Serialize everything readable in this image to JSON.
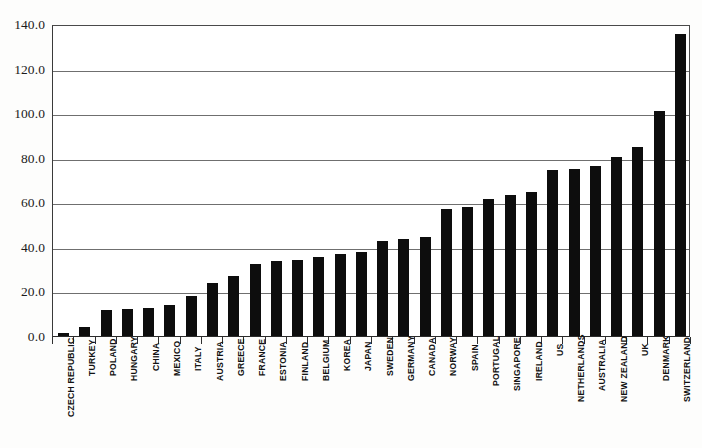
{
  "chart_data": {
    "type": "bar",
    "title": "",
    "subtitle": "",
    "xlabel": "",
    "ylabel": "",
    "ylim": [
      0,
      140
    ],
    "ytick_step": 20,
    "grid": true,
    "legend": null,
    "bar_color": "#0d0d0d",
    "plot_bg": "#ffffff",
    "axis_color": "#2f2f2f",
    "ytick_labels": [
      "0.0",
      "20.0",
      "40.0",
      "60.0",
      "80.0",
      "100.0",
      "120.0",
      "140.0"
    ],
    "yticks": [
      0,
      20,
      40,
      60,
      80,
      100,
      120,
      140
    ],
    "categories": [
      "CZECH REPUBLIC",
      "TURKEY",
      "POLAND",
      "HUNGARY",
      "CHINA",
      "MEXICO",
      "ITALY",
      "AUSTRIA",
      "GREECE",
      "FRANCE",
      "ESTONIA",
      "FINLAND",
      "BELGIUM",
      "KOREA",
      "JAPAN",
      "SWEDEN",
      "GERMANY",
      "CANADA",
      "NORWAY",
      "SPAIN",
      "PORTUGAL",
      "SINGAPORE",
      "IRELAND",
      "US",
      "NETHERLANDS",
      "AUSTRALIA",
      "NEW ZEALAND",
      "UK",
      "DENMARK",
      "SWITZERLAND"
    ],
    "values": [
      1.5,
      4.0,
      11.5,
      12.0,
      12.5,
      14.0,
      18.0,
      24.0,
      27.0,
      32.5,
      33.5,
      34.0,
      35.5,
      37.0,
      37.5,
      42.5,
      43.5,
      44.5,
      57.0,
      58.0,
      61.5,
      63.5,
      64.5,
      74.5,
      75.0,
      76.5,
      80.5,
      85.0,
      101.0,
      135.5
    ]
  }
}
